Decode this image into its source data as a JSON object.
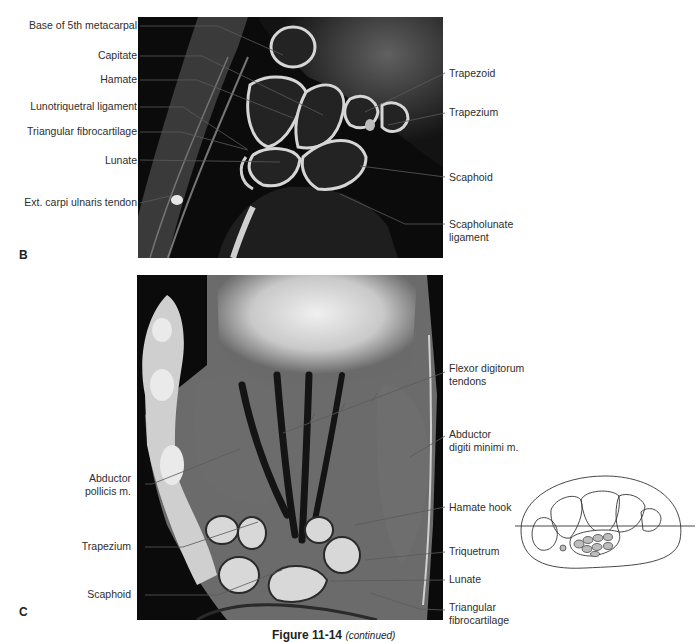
{
  "figure": {
    "caption_number": "Figure 11-14",
    "caption_suffix": "(continued)"
  },
  "panel_b": {
    "letter": "B",
    "labels_left": [
      "Base of 5th metacarpal",
      "Capitate",
      "Hamate",
      "Lunotriquetral ligament",
      "Triangular fibrocartilage",
      "Lunate",
      "Ext. carpi ulnaris tendon"
    ],
    "labels_right": [
      "Trapezoid",
      "Trapezium",
      "Scaphoid",
      "Scapholunate",
      "ligament"
    ]
  },
  "panel_c": {
    "letter": "C",
    "labels_left": [
      "Abductor",
      "pollicis m.",
      "Trapezium",
      "Scaphoid"
    ],
    "labels_right": [
      "Flexor digitorum",
      "tendons",
      "Abductor",
      "digiti minimi m.",
      "Hamate hook",
      "Triquetrum",
      "Lunate",
      "Triangular",
      "fibrocartilage"
    ]
  },
  "colors": {
    "background": "#ffffff",
    "mri_dark": "#0c0c0c",
    "mri_bone": "#2a2a2a",
    "mri_bright": "#d8d8d8",
    "leader_line": "#555555",
    "diagram_tendon_fill": "#bdbdbd"
  }
}
